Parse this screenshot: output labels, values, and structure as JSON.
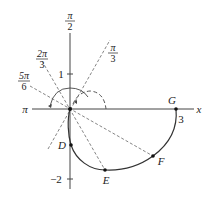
{
  "figure": {
    "type": "polar-curve-diagram",
    "axes": {
      "x_label": "x",
      "pi_label": "π",
      "y_tick_pos": "1",
      "y_tick_neg": "−2",
      "x_tick_3": "3"
    },
    "angle_labels": [
      {
        "id": "pi_over_2",
        "num": "π",
        "den": "2"
      },
      {
        "id": "pi_over_3",
        "num": "π",
        "den": "3"
      },
      {
        "id": "two_pi_over_3",
        "num": "2π",
        "den": "3"
      },
      {
        "id": "five_pi_over_6",
        "num": "5π",
        "den": "6"
      }
    ],
    "points": [
      {
        "label": "D"
      },
      {
        "label": "E"
      },
      {
        "label": "F"
      },
      {
        "label": "G"
      }
    ],
    "colors": {
      "line": "#333333",
      "dashed": "#555555",
      "text": "#222222"
    }
  }
}
